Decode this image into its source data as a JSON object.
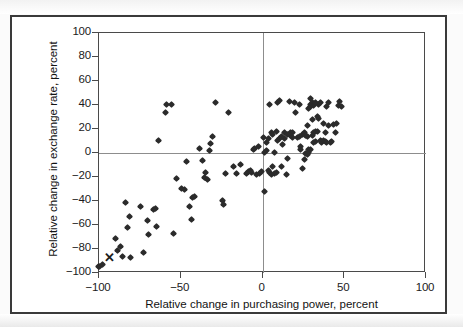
{
  "figure": {
    "background_color": "#fbfbfb",
    "frame_color": "#3a3a3a",
    "plot_border_color": "#4a4a4a",
    "marker_color": "#2b2b2b",
    "zero_line_color": "#8d8d8d"
  },
  "chart_data": {
    "type": "scatter",
    "title": "",
    "xlabel": "Relative change in purchasing power, percent",
    "ylabel": "Relative change in exchange rate, percent",
    "xlim": [
      -100,
      100
    ],
    "ylim": [
      -100,
      100
    ],
    "xticks": [
      -100,
      -50,
      0,
      50,
      100
    ],
    "xtick_labels": [
      "−100",
      "−50",
      "0",
      "50",
      "100"
    ],
    "yticks": [
      -100,
      -80,
      -60,
      -40,
      -20,
      0,
      20,
      40,
      60,
      80,
      100
    ],
    "ytick_labels": [
      "−100",
      "−80",
      "−60",
      "−40",
      "−20",
      "0",
      "20",
      "40",
      "60",
      "80",
      "100"
    ],
    "grid": false,
    "legend": null,
    "zero_reference_lines": {
      "x": 0,
      "y": 0
    },
    "series": [
      {
        "name": "countries",
        "marker": "diamond",
        "points": [
          [
            -100,
            -95
          ],
          [
            -99,
            -95
          ],
          [
            -97,
            -94
          ],
          [
            -89,
            -72
          ],
          [
            -88,
            -82
          ],
          [
            -86,
            -79
          ],
          [
            -85,
            -87
          ],
          [
            -83,
            -42
          ],
          [
            -82,
            -63
          ],
          [
            -81,
            -54
          ],
          [
            -80,
            -88
          ],
          [
            -74,
            -45
          ],
          [
            -72,
            -84
          ],
          [
            -70,
            -57
          ],
          [
            -69,
            -69
          ],
          [
            -66,
            -48
          ],
          [
            -65,
            -47
          ],
          [
            -64,
            -62
          ],
          [
            -63,
            10
          ],
          [
            -59,
            33
          ],
          [
            -58,
            40
          ],
          [
            -55,
            40
          ],
          [
            -54,
            -68
          ],
          [
            -52,
            -22
          ],
          [
            -49,
            -30
          ],
          [
            -47,
            -31
          ],
          [
            -46,
            -8
          ],
          [
            -44,
            -45
          ],
          [
            -43,
            -56
          ],
          [
            -42,
            -38
          ],
          [
            -41,
            -37
          ],
          [
            -38,
            3
          ],
          [
            -36,
            -7
          ],
          [
            -35,
            -21
          ],
          [
            -34,
            -17
          ],
          [
            -33,
            -23
          ],
          [
            -32,
            1
          ],
          [
            -31,
            7
          ],
          [
            -30,
            13
          ],
          [
            -28,
            41
          ],
          [
            -24,
            -40
          ],
          [
            -23,
            -44
          ],
          [
            -22,
            -18
          ],
          [
            -20,
            33
          ],
          [
            -17,
            -12
          ],
          [
            -15,
            -18
          ],
          [
            -13,
            -10
          ],
          [
            -9,
            -18
          ],
          [
            -8,
            -16
          ],
          [
            -7,
            -15
          ],
          [
            -6,
            -17
          ],
          [
            -5,
            2
          ],
          [
            -4,
            3
          ],
          [
            -3,
            -19
          ],
          [
            -2,
            5
          ],
          [
            -1,
            -18
          ],
          [
            0,
            -16
          ],
          [
            1,
            12
          ],
          [
            2,
            -33
          ],
          [
            3,
            8
          ],
          [
            4,
            11
          ],
          [
            5,
            40
          ],
          [
            6,
            16
          ],
          [
            7,
            15
          ],
          [
            8,
            0
          ],
          [
            9,
            17
          ],
          [
            10,
            41
          ],
          [
            11,
            43
          ],
          [
            12,
            -12
          ],
          [
            13,
            6
          ],
          [
            14,
            16
          ],
          [
            15,
            -19
          ],
          [
            16,
            -5
          ],
          [
            17,
            42
          ],
          [
            18,
            16
          ],
          [
            19,
            16
          ],
          [
            20,
            41
          ],
          [
            21,
            33
          ],
          [
            22,
            12
          ],
          [
            23,
            40
          ],
          [
            24,
            5
          ],
          [
            25,
            15
          ],
          [
            26,
            16
          ],
          [
            27,
            -1
          ],
          [
            28,
            22
          ],
          [
            29,
            2
          ],
          [
            30,
            45
          ],
          [
            31,
            27
          ],
          [
            32,
            8
          ],
          [
            33,
            9
          ],
          [
            34,
            17
          ],
          [
            35,
            40
          ],
          [
            36,
            41
          ],
          [
            37,
            8
          ],
          [
            38,
            24
          ],
          [
            39,
            16
          ],
          [
            40,
            38
          ],
          [
            41,
            41
          ],
          [
            42,
            8
          ],
          [
            43,
            9
          ],
          [
            44,
            23
          ],
          [
            45,
            16
          ],
          [
            46,
            24
          ],
          [
            47,
            39
          ],
          [
            48,
            42
          ],
          [
            49,
            38
          ],
          [
            30,
            40
          ],
          [
            31,
            41
          ],
          [
            32,
            39
          ],
          [
            33,
            41
          ],
          [
            30,
            38
          ],
          [
            29,
            36
          ],
          [
            28,
            13
          ],
          [
            27,
            14
          ],
          [
            26,
            -6
          ],
          [
            25,
            -14
          ],
          [
            24,
            2
          ],
          [
            23,
            13
          ],
          [
            19,
            12
          ],
          [
            18,
            14
          ],
          [
            17,
            15
          ],
          [
            16,
            15
          ],
          [
            14,
            11
          ],
          [
            12,
            13
          ],
          [
            11,
            11
          ],
          [
            10,
            10
          ],
          [
            9,
            -17
          ],
          [
            8,
            -18
          ],
          [
            7,
            -12
          ],
          [
            6,
            -19
          ],
          [
            5,
            -17
          ],
          [
            4,
            -15
          ],
          [
            3,
            1
          ],
          [
            2,
            0
          ],
          [
            36,
            10
          ],
          [
            37,
            9
          ],
          [
            38,
            10
          ],
          [
            39,
            9
          ],
          [
            40,
            8
          ],
          [
            41,
            22
          ],
          [
            35,
            28
          ],
          [
            34,
            30
          ],
          [
            33,
            17
          ],
          [
            32,
            16
          ],
          [
            31,
            14
          ],
          [
            30,
            2
          ],
          [
            29,
            0
          ],
          [
            28,
            -2
          ]
        ]
      },
      {
        "name": "highlighted-country",
        "marker": "x",
        "points": [
          [
            -93,
            -88
          ]
        ]
      }
    ]
  }
}
